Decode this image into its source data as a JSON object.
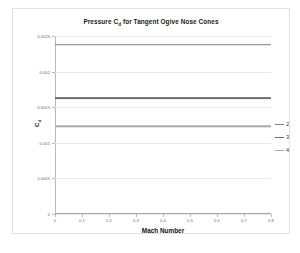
{
  "chart_data": {
    "type": "line",
    "title_main": "Pressure C",
    "title_sub": "d",
    "title_rest": " for Tangent Ogive Nose Cones",
    "xlabel": "Mach Number",
    "ylabel": "C_d",
    "ylabel_main": "C",
    "ylabel_sub": "d",
    "xlim": [
      0,
      0.8
    ],
    "ylim": [
      0,
      0.0025
    ],
    "grid": "horizontal",
    "legend_position": "right",
    "xticks": [
      "0",
      "0.1",
      "0.2",
      "0.3",
      "0.4",
      "0.5",
      "0.6",
      "0.7",
      "0.8"
    ],
    "xtick_values": [
      0,
      0.1,
      0.2,
      0.3,
      0.4,
      0.5,
      0.6,
      0.7,
      0.8
    ],
    "yticks": [
      "0",
      "0.0005",
      "0.001",
      "0.0015",
      "0.002",
      "0.0025"
    ],
    "ytick_values": [
      0,
      0.0005,
      0.001,
      0.0015,
      0.002,
      0.0025
    ],
    "x": [
      0,
      0.8
    ],
    "series": [
      {
        "name": "2",
        "values": [
          0.00238,
          0.00238
        ],
        "constant_value": 0.00238,
        "color": "#808080",
        "width": 1.6
      },
      {
        "name": "3",
        "values": [
          0.00163,
          0.00163
        ],
        "constant_value": 0.00163,
        "color": "#6e6e6e",
        "width": 1.8
      },
      {
        "name": "4",
        "values": [
          0.00123,
          0.00123
        ],
        "constant_value": 0.00123,
        "color": "#aaaaaa",
        "width": 1.4
      }
    ]
  },
  "legend": {
    "items": [
      {
        "label": "2",
        "color": "#808080"
      },
      {
        "label": "3",
        "color": "#6e6e6e"
      },
      {
        "label": "4",
        "color": "#aaaaaa"
      }
    ]
  },
  "colors": {
    "background": "#ffffff",
    "frame": "#e2e2e2",
    "gridline": "#e9e9e9",
    "axis": "#b8b8b8",
    "text": "#6d6d6d",
    "title_text": "#1a1a1a"
  }
}
